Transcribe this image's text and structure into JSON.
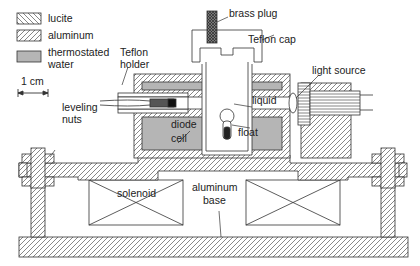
{
  "legend": {
    "items": [
      {
        "label": "lucite",
        "pattern": "backslash-hatch"
      },
      {
        "label": "aluminum",
        "pattern": "slash-hatch"
      },
      {
        "label_line1": "thermostated",
        "label_line2": "water",
        "pattern": "gray-fill"
      }
    ],
    "scale_label": "1 cm"
  },
  "labels": {
    "brass_plug": "brass plug",
    "teflon_cap": "Teflon cap",
    "teflon_holder_line1": "Teflon",
    "teflon_holder_line2": "holder",
    "light_source": "light source",
    "liquid": "liquid",
    "leveling_nuts_line1": "leveling",
    "leveling_nuts_line2": "nuts",
    "diode_cell_line1": "diode",
    "diode_cell_line2": "cell",
    "float": "float",
    "solenoid": "solenoid",
    "aluminum_base_line1": "aluminum",
    "aluminum_base_line2": "base"
  },
  "colors": {
    "line": "#333333",
    "water_fill": "#b5b5b5",
    "hatch": "#555555",
    "background": "#ffffff"
  }
}
